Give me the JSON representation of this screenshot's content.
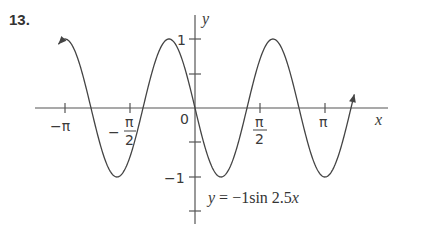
{
  "problem_number": "13.",
  "chart_data": {
    "type": "line",
    "title": "",
    "equation_label": "y = −1sin 2.5x",
    "equation": {
      "y": "y",
      "eq": "=",
      "rhs": "−1sin 2.5",
      "x": "x"
    },
    "xlabel": "x",
    "ylabel": "y",
    "xlim": [
      -3.6,
      4.7
    ],
    "ylim": [
      -1.5,
      1.5
    ],
    "x_ticks": [
      {
        "value": -3.1416,
        "label": "−π"
      },
      {
        "value": -1.5708,
        "label": "−π/2"
      },
      {
        "value": 1.5708,
        "label": "π/2"
      },
      {
        "value": 3.1416,
        "label": "π"
      }
    ],
    "y_ticks": [
      {
        "value": 1,
        "label": "1"
      },
      {
        "value": 0.5,
        "label": ""
      },
      {
        "value": -0.5,
        "label": ""
      },
      {
        "value": -1,
        "label": "−1"
      },
      {
        "value": -1.5,
        "label": ""
      }
    ],
    "origin_label": "0",
    "grid": false,
    "series": [
      {
        "name": "y = -sin(2.5x)",
        "function": "-sin(2.5x)",
        "domain": [
          -3.3,
          3.85
        ],
        "arrows_at_ends": true,
        "points": [
          {
            "x": -3.3,
            "y": 0.926
          },
          {
            "x": -3.142,
            "y": 1.0
          },
          {
            "x": -2.513,
            "y": 0
          },
          {
            "x": -1.885,
            "y": -1.0
          },
          {
            "x": -1.257,
            "y": 0
          },
          {
            "x": -0.628,
            "y": 1.0
          },
          {
            "x": 0,
            "y": 0
          },
          {
            "x": 0.628,
            "y": -1.0
          },
          {
            "x": 1.257,
            "y": 0
          },
          {
            "x": 1.885,
            "y": 1.0
          },
          {
            "x": 2.513,
            "y": 0
          },
          {
            "x": 3.142,
            "y": -1.0
          },
          {
            "x": 3.85,
            "y": -0.833
          }
        ]
      }
    ],
    "colors": {
      "axis": "#555555",
      "curve": "#444444",
      "text": "#333333"
    }
  }
}
